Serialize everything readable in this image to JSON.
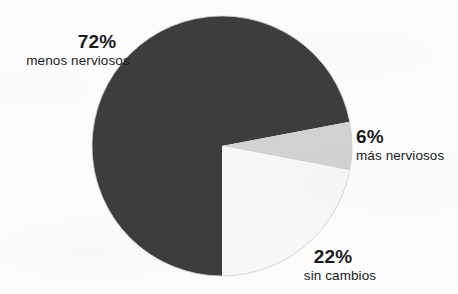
{
  "chart_data": {
    "type": "pie",
    "title": "",
    "subtitle": "",
    "xlabel": "",
    "ylabel": "",
    "legend_position": "none",
    "grid": false,
    "units": "percent",
    "total": 100,
    "start_angle_deg": 180,
    "direction": "clockwise",
    "categories": [
      "menos nerviosos",
      "más nerviosos",
      "sin cambios"
    ],
    "values": [
      72,
      6,
      22
    ],
    "slices": [
      {
        "label": "menos nerviosos",
        "value": 72,
        "value_label": "72%",
        "color": "#3d3d3d",
        "start_angle_deg": 180.0,
        "end_angle_deg": 439.2
      },
      {
        "label": "más nerviosos",
        "value": 6,
        "value_label": "6%",
        "color": "#d2d2d2",
        "start_angle_deg": 79.2,
        "end_angle_deg": 100.8
      },
      {
        "label": "sin cambios",
        "value": 22,
        "value_label": "22%",
        "color": "#f7f7f7",
        "start_angle_deg": 100.8,
        "end_angle_deg": 180.0
      }
    ]
  },
  "geometry": {
    "center_x": 222,
    "center_y": 146,
    "radius": 130
  },
  "colors": {
    "background": "#fcfcfc",
    "slice_less_nervous": "#3d3d3d",
    "slice_more_nervous": "#d2d2d2",
    "slice_no_change": "#f7f7f7",
    "slice_outline": "#cfcfcf",
    "text": "#1c1c1c"
  },
  "callouts": {
    "less_nervous": {
      "percent": "72%",
      "description": "menos nerviosos"
    },
    "more_nervous": {
      "percent": "6%",
      "description": "más nerviosos"
    },
    "no_change": {
      "percent": "22%",
      "description": "sin cambios"
    }
  }
}
